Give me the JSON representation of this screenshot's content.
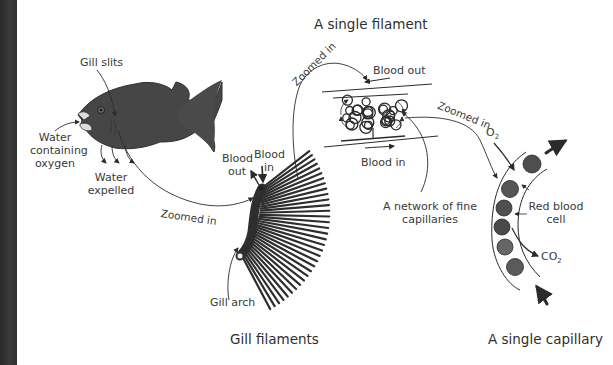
{
  "titles": {
    "single_filament": "A single filament",
    "gill_filaments": "Gill filaments",
    "single_capillary": "A single capillary"
  },
  "fish_labels": {
    "gill_slits": "Gill slits",
    "water_in_line1": "Water",
    "water_in_line2": "containing",
    "water_in_line3": "oxygen",
    "water_out_line1": "Water",
    "water_out_line2": "expelled"
  },
  "zoom_labels": {
    "fish_to_gill": "Zoomed in",
    "gill_to_filament": "Zoomed in",
    "filament_to_capillary": "Zoomed in"
  },
  "gill_labels": {
    "blood_out_line1": "Blood",
    "blood_out_line2": "out",
    "blood_in_line1": "Blood",
    "blood_in_line2": "in",
    "gill_arch": "Gill arch"
  },
  "filament_labels": {
    "blood_out": "Blood out",
    "blood_in": "Blood in",
    "network_line1": "A network of fine",
    "network_line2": "capillaries"
  },
  "capillary_labels": {
    "oxygen_main": "O",
    "oxygen_sub": "2",
    "co2_main": "CO",
    "co2_sub": "2",
    "rbc_line1": "Red blood",
    "rbc_line2": "cell"
  },
  "colors": {
    "ink": "#2b2b2b",
    "fish": "#454545",
    "rbc": "#505050",
    "strip": "#333333"
  }
}
